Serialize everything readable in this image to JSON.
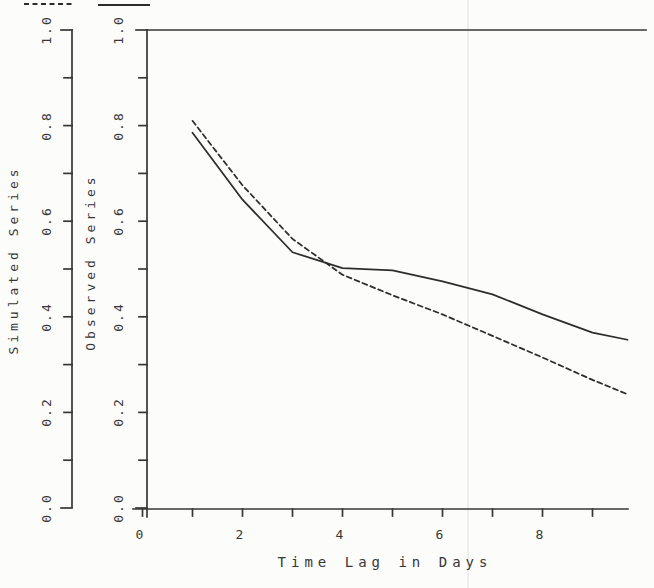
{
  "figure": {
    "kind": "scanned autocorrelation comparison plot",
    "paper_color": "#fcfcfb",
    "ink_color": "#373737",
    "curve_color": "#2d2d2d"
  },
  "legend": {
    "keys": [
      {
        "icon": "dashed-line-key",
        "series": "Simulated Series",
        "style": "dashed"
      },
      {
        "icon": "solid-line-key",
        "series": "Observed Series",
        "style": "solid"
      }
    ]
  },
  "axes": {
    "y_sim": {
      "title": "Simulated Series",
      "tick_labels": [
        "0.0",
        "0.2",
        "0.4",
        "0.6",
        "0.8",
        "1.0"
      ]
    },
    "y_obs": {
      "title": "Observed Series",
      "tick_labels": [
        "0.0",
        "0.2",
        "0.4",
        "0.6",
        "0.8",
        "1.0"
      ]
    },
    "x": {
      "title": "Time Lag in Days",
      "tick_labels": [
        "0",
        "2",
        "4",
        "6",
        "8"
      ]
    }
  },
  "chart_data": {
    "type": "line",
    "title": "",
    "xlabel": "Time Lag in Days",
    "ylabel_left": "Simulated Series",
    "ylabel_right": "Observed Series",
    "x": [
      1,
      2,
      3,
      4,
      5,
      6,
      7,
      8,
      9,
      9.7
    ],
    "series": [
      {
        "name": "Simulated Series",
        "style": "dashed",
        "values": [
          0.81,
          0.675,
          0.563,
          0.488,
          0.445,
          0.405,
          0.36,
          0.315,
          0.268,
          0.238
        ]
      },
      {
        "name": "Observed Series",
        "style": "solid",
        "values": [
          0.785,
          0.645,
          0.535,
          0.502,
          0.497,
          0.474,
          0.447,
          0.405,
          0.367,
          0.352
        ]
      }
    ],
    "xlim": [
      0,
      9.7
    ],
    "ylim": [
      0,
      1
    ],
    "x_tick_step_minor": 1,
    "x_tick_step_labeled": 2,
    "y_tick_step_minor": 0.1,
    "y_tick_step_labeled": 0.2,
    "reference_line_y": 1.0,
    "grid": false,
    "legend_position": "top-left, clipped line samples"
  }
}
